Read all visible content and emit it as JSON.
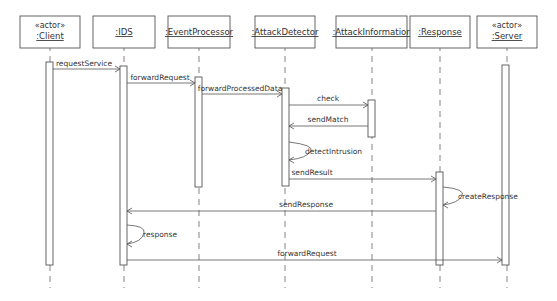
{
  "diagram": {
    "type": "uml-sequence-diagram",
    "participants": [
      {
        "id": "client",
        "stereotype": "«actor»",
        "label": ":Client",
        "x": 50
      },
      {
        "id": "ids",
        "stereotype": "",
        "label": ":IDS",
        "x": 124
      },
      {
        "id": "event-processor",
        "stereotype": "",
        "label": ":EventProcessor",
        "x": 199
      },
      {
        "id": "attack-detector",
        "stereotype": "",
        "label": ":AttackDetector",
        "x": 285
      },
      {
        "id": "attack-information",
        "stereotype": "",
        "label": ":AttackInformation",
        "x": 372
      },
      {
        "id": "response",
        "stereotype": "",
        "label": ":Response",
        "x": 440
      },
      {
        "id": "server",
        "stereotype": "«actor»",
        "label": ":Server",
        "x": 507
      }
    ],
    "messages": [
      {
        "label": "requestService",
        "from": "client",
        "to": "ids",
        "y": 69
      },
      {
        "label": "forwardRequest",
        "from": "ids",
        "to": "event-processor",
        "y": 83
      },
      {
        "label": "forwardProcessedData",
        "from": "event-processor",
        "to": "attack-detector",
        "y": 94
      },
      {
        "label": "check",
        "from": "attack-detector",
        "to": "attack-information",
        "y": 105
      },
      {
        "label": "sendMatch",
        "from": "attack-information",
        "to": "attack-detector",
        "y": 126
      },
      {
        "label": "detectIntrusion",
        "from": "attack-detector",
        "to": "attack-detector",
        "self": true,
        "y": 142
      },
      {
        "label": "sendResult",
        "from": "attack-detector",
        "to": "response",
        "y": 179
      },
      {
        "label": "createResponse",
        "from": "response",
        "to": "response",
        "self": true,
        "y": 197
      },
      {
        "label": "sendResponse",
        "from": "response",
        "to": "ids",
        "y": 211
      },
      {
        "label": "response",
        "from": "ids",
        "to": "ids",
        "self": true,
        "y": 235
      },
      {
        "label": "forwardRequest",
        "from": "ids",
        "to": "server",
        "y": 260
      }
    ]
  }
}
